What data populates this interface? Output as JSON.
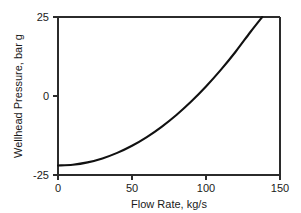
{
  "chart_data": {
    "type": "line",
    "title": "",
    "xlabel": "Flow Rate, kg/s",
    "ylabel": "Wellhead Pressure, bar g",
    "xlim": [
      0,
      150
    ],
    "ylim": [
      -25,
      25
    ],
    "xticks": [
      0,
      50,
      100,
      150
    ],
    "yticks": [
      -25,
      0,
      25
    ],
    "xtick_labels": [
      "0",
      "50",
      "100",
      "150"
    ],
    "ytick_labels": [
      "-25",
      "0",
      "25"
    ],
    "grid": false,
    "legend": null,
    "series": [
      {
        "name": "Wellhead Pressure",
        "color": "#111111",
        "x": [
          0,
          10,
          20,
          30,
          40,
          50,
          60,
          70,
          80,
          90,
          100,
          110,
          120,
          130,
          138
        ],
        "y": [
          -22.0,
          -21.75,
          -21.0,
          -19.75,
          -18.0,
          -15.75,
          -13.0,
          -9.75,
          -6.0,
          -1.75,
          3.0,
          8.25,
          14.0,
          20.25,
          25.0
        ]
      }
    ],
    "annotations": []
  },
  "axis": {
    "x_title": "Flow Rate, kg/s",
    "y_title": "Wellhead Pressure, bar g",
    "x_tick_labels": [
      "0",
      "50",
      "100",
      "150"
    ],
    "y_tick_labels": [
      "25",
      "0",
      "-25"
    ]
  },
  "colors": {
    "curve": "#111111",
    "frame": "#2b2b2b",
    "text": "#1a1a1a",
    "background": "#ffffff"
  }
}
